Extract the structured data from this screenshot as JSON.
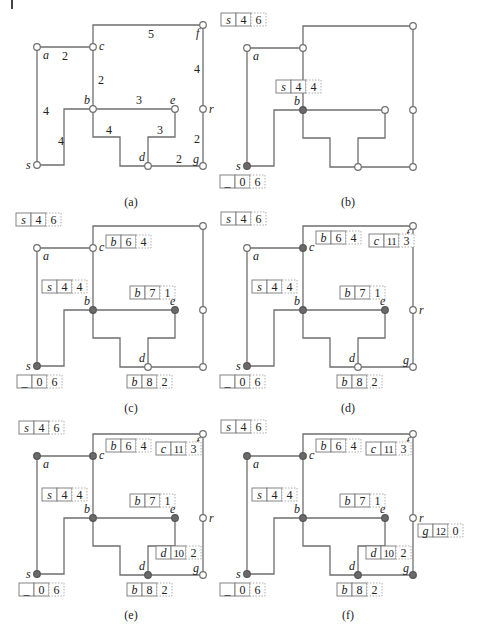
{
  "figure": {
    "colors": {
      "edge": "#6e6e6e",
      "filled_node": "#6a6a6a",
      "open_node": "#ffffff",
      "text": "#222222"
    },
    "graph": {
      "nodes": {
        "s": [
          37,
          165
        ],
        "a": [
          37,
          47
        ],
        "c": [
          93,
          47
        ],
        "f": [
          203,
          25
        ],
        "b": [
          93,
          109
        ],
        "e": [
          175,
          109
        ],
        "r": [
          203,
          109
        ],
        "d": [
          148,
          166
        ],
        "g": [
          203,
          166
        ]
      },
      "node_label_offsets": {
        "s": [
          -11,
          4
        ],
        "a": [
          6,
          12
        ],
        "c": [
          6,
          3
        ],
        "f": [
          -7,
          12
        ],
        "b": [
          -9,
          -5
        ],
        "e": [
          -5,
          -5
        ],
        "r": [
          6,
          4
        ],
        "d": [
          -9,
          -5
        ],
        "g": [
          -10,
          -3
        ]
      },
      "edges": [
        {
          "from": "s",
          "to": "a",
          "weight": "4",
          "path": [
            [
              37,
              165
            ],
            [
              37,
              47
            ]
          ],
          "wlabel": [
            43,
            115
          ]
        },
        {
          "from": "a",
          "to": "c",
          "weight": "2",
          "path": [
            [
              37,
              47
            ],
            [
              93,
              47
            ]
          ],
          "wlabel": [
            62,
            60
          ]
        },
        {
          "from": "c",
          "to": "f",
          "weight": "5",
          "path": [
            [
              93,
              47
            ],
            [
              93,
              25
            ],
            [
              203,
              25
            ]
          ],
          "wlabel": [
            148,
            38
          ]
        },
        {
          "from": "c",
          "to": "b",
          "weight": "2",
          "path": [
            [
              93,
              47
            ],
            [
              93,
              109
            ]
          ],
          "wlabel": [
            98,
            84
          ]
        },
        {
          "from": "s",
          "to": "b",
          "weight": "4",
          "path": [
            [
              37,
              165
            ],
            [
              64,
              165
            ],
            [
              64,
              109
            ],
            [
              93,
              109
            ]
          ],
          "wlabel": [
            58,
            145
          ]
        },
        {
          "from": "b",
          "to": "e",
          "weight": "3",
          "path": [
            [
              93,
              109
            ],
            [
              175,
              109
            ]
          ],
          "wlabel": [
            136,
            104
          ]
        },
        {
          "from": "b",
          "to": "d",
          "weight": "4",
          "path": [
            [
              93,
              109
            ],
            [
              93,
              137
            ],
            [
              120,
              137
            ],
            [
              120,
              166
            ],
            [
              148,
              166
            ]
          ],
          "wlabel": [
            106,
            134
          ]
        },
        {
          "from": "e",
          "to": "d",
          "weight": "3",
          "path": [
            [
              175,
              109
            ],
            [
              175,
              137
            ],
            [
              148,
              137
            ],
            [
              148,
              166
            ]
          ],
          "wlabel": [
            157,
            134
          ]
        },
        {
          "from": "d",
          "to": "g",
          "weight": "2",
          "path": [
            [
              148,
              166
            ],
            [
              203,
              166
            ]
          ],
          "wlabel": [
            176,
            163
          ]
        },
        {
          "from": "f",
          "to": "r",
          "weight": "4",
          "path": [
            [
              203,
              25
            ],
            [
              203,
              109
            ]
          ],
          "wlabel": [
            194,
            73
          ]
        },
        {
          "from": "r",
          "to": "g",
          "weight": "2",
          "path": [
            [
              203,
              109
            ],
            [
              203,
              166
            ]
          ],
          "wlabel": [
            194,
            143
          ]
        }
      ]
    },
    "panels": [
      {
        "id": "a",
        "caption": "(a)",
        "offset": [
          0,
          0
        ],
        "caption_pos": [
          131,
          206
        ],
        "show_weights": true,
        "show_all_labels": true,
        "filled": [],
        "labels": [
          "s",
          "a",
          "c",
          "f",
          "b",
          "e",
          "r",
          "d",
          "g"
        ],
        "tables": []
      },
      {
        "id": "b",
        "caption": "(b)",
        "offset": [
          210,
          1
        ],
        "caption_pos": [
          348,
          206
        ],
        "show_weights": false,
        "filled": [
          "s",
          "b"
        ],
        "labels": [
          "s",
          "a",
          "b"
        ],
        "tables": [
          {
            "node": "a",
            "pos": [
              -26,
              -35
            ],
            "cells": [
              "s",
              "4",
              "6"
            ]
          },
          {
            "node": "b",
            "pos": [
              -27,
              -30
            ],
            "cells": [
              "s",
              "4",
              "4"
            ]
          },
          {
            "node": "s",
            "pos": [
              -27,
              9
            ],
            "cells": [
              "_",
              "0",
              "6"
            ]
          }
        ]
      },
      {
        "id": "c",
        "caption": "(c)",
        "offset": [
          0,
          201
        ],
        "caption_pos": [
          131,
          412
        ],
        "show_weights": false,
        "filled": [
          "s",
          "b",
          "e"
        ],
        "labels": [
          "s",
          "a",
          "c",
          "b",
          "e",
          "d"
        ],
        "tables": [
          {
            "node": "a",
            "pos": [
              -21,
              -35
            ],
            "cells": [
              "s",
              "4",
              "6"
            ]
          },
          {
            "node": "b",
            "pos": [
              -51,
              -30
            ],
            "cells": [
              "s",
              "4",
              "4"
            ]
          },
          {
            "node": "s",
            "pos": [
              -20,
              9
            ],
            "cells": [
              "_",
              "0",
              "6"
            ]
          },
          {
            "node": "c",
            "pos": [
              13,
              -13
            ],
            "cells": [
              "b",
              "6",
              "4"
            ]
          },
          {
            "node": "e",
            "pos": [
              -45,
              -24
            ],
            "cells": [
              "b",
              "7",
              "1"
            ]
          },
          {
            "node": "d",
            "pos": [
              -21,
              8
            ],
            "cells": [
              "b",
              "8",
              "2"
            ]
          }
        ]
      },
      {
        "id": "d",
        "caption": "(d)",
        "offset": [
          210,
          201
        ],
        "caption_pos": [
          348,
          412
        ],
        "show_weights": false,
        "filled": [
          "s",
          "b",
          "e",
          "c"
        ],
        "labels": [
          "s",
          "a",
          "c",
          "f",
          "b",
          "e",
          "r",
          "d",
          "g"
        ],
        "tables": [
          {
            "node": "a",
            "pos": [
              -26,
              -36
            ],
            "cells": [
              "s",
              "4",
              "6"
            ]
          },
          {
            "node": "b",
            "pos": [
              -51,
              -30
            ],
            "cells": [
              "s",
              "4",
              "4"
            ]
          },
          {
            "node": "s",
            "pos": [
              -27,
              9
            ],
            "cells": [
              "_",
              "0",
              "6"
            ]
          },
          {
            "node": "c",
            "pos": [
              13,
              -17
            ],
            "cells": [
              "b",
              "6",
              "4"
            ]
          },
          {
            "node": "f",
            "pos": [
              -44,
              8
            ],
            "cells": [
              "c",
              "11",
              "3"
            ]
          },
          {
            "node": "e",
            "pos": [
              -45,
              -24
            ],
            "cells": [
              "b",
              "7",
              "1"
            ]
          },
          {
            "node": "d",
            "pos": [
              -21,
              8
            ],
            "cells": [
              "b",
              "8",
              "2"
            ]
          }
        ]
      },
      {
        "id": "e",
        "caption": "(e)",
        "offset": [
          0,
          409
        ],
        "caption_pos": [
          131,
          619
        ],
        "show_weights": false,
        "filled": [
          "s",
          "b",
          "e",
          "c",
          "a",
          "d"
        ],
        "labels": [
          "s",
          "a",
          "c",
          "f",
          "b",
          "e",
          "r",
          "d",
          "g"
        ],
        "tables": [
          {
            "node": "a",
            "pos": [
              -18,
              -35
            ],
            "cells": [
              "s",
              "4",
              "6"
            ]
          },
          {
            "node": "b",
            "pos": [
              -51,
              -30
            ],
            "cells": [
              "s",
              "4",
              "4"
            ]
          },
          {
            "node": "s",
            "pos": [
              -18,
              9
            ],
            "cells": [
              "_",
              "0",
              "6"
            ]
          },
          {
            "node": "c",
            "pos": [
              13,
              -17
            ],
            "cells": [
              "b",
              "6",
              "4"
            ]
          },
          {
            "node": "f",
            "pos": [
              -47,
              8
            ],
            "cells": [
              "c",
              "11",
              "3"
            ]
          },
          {
            "node": "e",
            "pos": [
              -45,
              -24
            ],
            "cells": [
              "b",
              "7",
              "1"
            ]
          },
          {
            "node": "d",
            "pos": [
              8,
              -29
            ],
            "cells": [
              "d",
              "10",
              "2"
            ]
          },
          {
            "node": "d",
            "pos": [
              -21,
              8
            ],
            "cells": [
              "b",
              "8",
              "2"
            ]
          }
        ]
      },
      {
        "id": "f",
        "caption": "(f)",
        "offset": [
          210,
          409
        ],
        "caption_pos": [
          348,
          619
        ],
        "show_weights": false,
        "filled": [
          "s",
          "b",
          "e",
          "c",
          "a",
          "d",
          "g"
        ],
        "labels": [
          "s",
          "a",
          "c",
          "f",
          "b",
          "e",
          "r",
          "d",
          "g"
        ],
        "tables": [
          {
            "node": "a",
            "pos": [
              -26,
              -36
            ],
            "cells": [
              "s",
              "4",
              "6"
            ]
          },
          {
            "node": "b",
            "pos": [
              -51,
              -30
            ],
            "cells": [
              "s",
              "4",
              "4"
            ]
          },
          {
            "node": "s",
            "pos": [
              -27,
              9
            ],
            "cells": [
              "_",
              "0",
              "6"
            ]
          },
          {
            "node": "c",
            "pos": [
              13,
              -17
            ],
            "cells": [
              "b",
              "6",
              "4"
            ]
          },
          {
            "node": "f",
            "pos": [
              -47,
              8
            ],
            "cells": [
              "c",
              "11",
              "3"
            ]
          },
          {
            "node": "e",
            "pos": [
              -45,
              -24
            ],
            "cells": [
              "b",
              "7",
              "1"
            ]
          },
          {
            "node": "d",
            "pos": [
              8,
              -29
            ],
            "cells": [
              "d",
              "10",
              "2"
            ]
          },
          {
            "node": "d",
            "pos": [
              -21,
              8
            ],
            "cells": [
              "b",
              "8",
              "2"
            ]
          },
          {
            "node": "r",
            "pos": [
              5,
              6
            ],
            "cells": [
              "g",
              "12",
              "0"
            ]
          }
        ]
      }
    ]
  }
}
